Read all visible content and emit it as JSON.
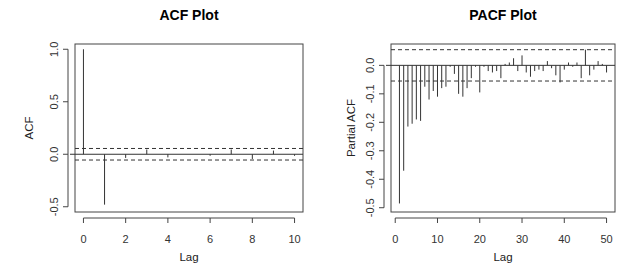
{
  "chart_data": [
    {
      "type": "bar",
      "title": "ACF Plot",
      "xlabel": "Lag",
      "ylabel": "ACF",
      "xlim": [
        -0.4,
        10.4
      ],
      "ylim": [
        -0.55,
        1.05
      ],
      "xticks": [
        0,
        2,
        4,
        6,
        8,
        10
      ],
      "yticks": [
        -0.5,
        0.0,
        0.5,
        1.0
      ],
      "ytick_labels": [
        "-0.5",
        "0.0",
        "0.5",
        "1.0"
      ],
      "conf_band": 0.055,
      "grid": false,
      "x": [
        0,
        1,
        2,
        3,
        4,
        5,
        6,
        7,
        8,
        9,
        10
      ],
      "values": [
        1.0,
        -0.48,
        -0.035,
        0.045,
        -0.03,
        0.0,
        -0.015,
        0.045,
        -0.045,
        0.035,
        -0.015
      ]
    },
    {
      "type": "bar",
      "title": "PACF Plot",
      "xlabel": "Lag",
      "ylabel": "Partial ACF",
      "xlim": [
        -1,
        52
      ],
      "ylim": [
        -0.515,
        0.075
      ],
      "xticks": [
        0,
        10,
        20,
        30,
        40,
        50
      ],
      "yticks": [
        -0.5,
        -0.4,
        -0.3,
        -0.2,
        -0.1,
        0.0
      ],
      "ytick_labels": [
        "-0.5",
        "-0.4",
        "-0.3",
        "-0.2",
        "-0.1",
        "0.0"
      ],
      "conf_band": 0.055,
      "grid": false,
      "x": [
        1,
        2,
        3,
        4,
        5,
        6,
        7,
        8,
        9,
        10,
        11,
        12,
        13,
        14,
        15,
        16,
        17,
        18,
        19,
        20,
        21,
        22,
        23,
        24,
        25,
        26,
        27,
        28,
        29,
        30,
        31,
        32,
        33,
        34,
        35,
        36,
        37,
        38,
        39,
        40,
        41,
        42,
        43,
        44,
        45,
        46,
        47,
        48,
        49,
        50
      ],
      "values": [
        -0.485,
        -0.37,
        -0.215,
        -0.205,
        -0.19,
        -0.195,
        -0.075,
        -0.12,
        -0.09,
        -0.11,
        -0.08,
        -0.075,
        -0.005,
        -0.03,
        -0.1,
        -0.11,
        -0.08,
        -0.045,
        -0.005,
        -0.095,
        -0.005,
        -0.02,
        -0.025,
        -0.02,
        -0.045,
        0.005,
        0.01,
        0.025,
        -0.02,
        0.035,
        -0.025,
        -0.04,
        -0.02,
        -0.015,
        -0.02,
        0.015,
        -0.01,
        -0.035,
        -0.06,
        -0.015,
        0.01,
        -0.005,
        0.01,
        -0.045,
        0.055,
        -0.035,
        -0.015,
        0.015,
        0.005,
        -0.025
      ]
    }
  ]
}
